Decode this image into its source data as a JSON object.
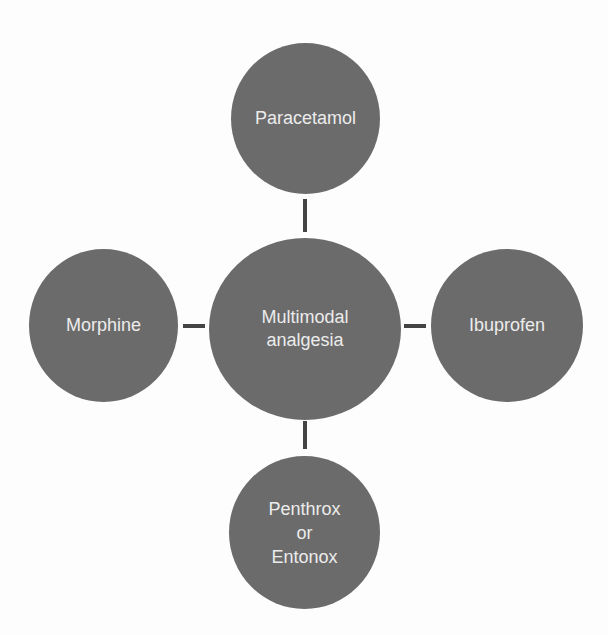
{
  "diagram": {
    "type": "hub-and-spoke",
    "colors": {
      "node_fill": "#6b6b6b",
      "node_text": "#ececec",
      "connector": "#444444",
      "background": "#fdfdfd"
    },
    "center": {
      "lines": [
        "Multimodal",
        "analgesia"
      ]
    },
    "spokes": {
      "top": {
        "lines": [
          "Paracetamol"
        ]
      },
      "left": {
        "lines": [
          "Morphine"
        ]
      },
      "right": {
        "lines": [
          "Ibuprofen"
        ]
      },
      "bottom": {
        "lines": [
          "Penthrox",
          "or",
          "Entonox"
        ]
      }
    }
  }
}
